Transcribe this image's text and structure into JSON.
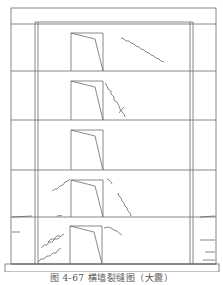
{
  "figure": {
    "caption": "图 4-67   横墙裂缝图（大震）",
    "stroke_color": "#6a6a6a",
    "crack_color": "#555555",
    "outer_frame": {
      "x": 11,
      "y": 8,
      "w": 205,
      "h": 256
    },
    "base_slab": {
      "x": 5,
      "y": 264,
      "w": 214,
      "h": 8
    },
    "roof_band_y": 24,
    "inner_wall_left": [
      35,
      38
    ],
    "inner_wall_right": [
      190,
      193
    ],
    "floor_lines_y": [
      71,
      120,
      170,
      217,
      264
    ],
    "openings": [
      {
        "floor": 5,
        "x": 71,
        "top": 33,
        "bottom": 71
      },
      {
        "floor": 4,
        "x": 71,
        "top": 81,
        "bottom": 120
      },
      {
        "floor": 3,
        "x": 71,
        "top": 130,
        "bottom": 170
      },
      {
        "floor": 2,
        "x": 71,
        "top": 180,
        "bottom": 217
      },
      {
        "floor": 1,
        "x": 70,
        "top": 226,
        "bottom": 264
      }
    ],
    "cracks": [
      "M121,38 l3,1 l2,2 l3,0 l2,2 l3,1 l2,2 l3,1 l2,2 l3,1 l2,2 l3,1 l2,2 l3,1 l2,2 l3,1 l2,2 l3,1",
      "M105,83 l2,3 l1,3 l3,2 l0,3 l3,3 l0,3 l3,2 l2,4 l1,3 l2,3 l2,2 l1,3",
      "M119,113 l3,-4 l2,-2",
      "M52,191 l3,-2 l2,0 l3,-3 l3,-1 l2,-3 l3,-1 l2,-2",
      "M107,179 l2,1 l2,2 l1,2",
      "M118,193 l1,3 l2,2 l1,3 l2,2 l1,3 l2,2 l1,3 l2,2 l1,3",
      "M57,216 l5,-0.5",
      "M12,217 l20,-1",
      "M200,217 l15,-1",
      "M38,262 l3,-3 l3,0 l3,-3 l3,0 l3,-3 l3,0 l2,-3 l3,-2",
      "M41,248 l3,-3 l3,0 l2,-3 l3,0 l3,-3 l3,0 l3,-3 l3,-2",
      "M48,242 l3,-3 l3,0 l3,-3 l3,0",
      "M104,228 l4,-1 l3,1 l3,2 l3,1 l2,2 l3,2",
      "M12,232 l8,0",
      "M200,240 l15,0",
      "M205,252 l10,0",
      "M203,260 l12,0"
    ]
  }
}
